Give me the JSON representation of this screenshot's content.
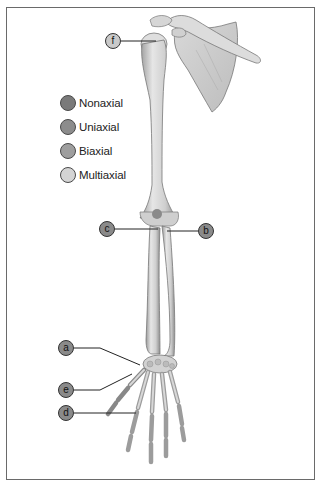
{
  "figure": {
    "title": ""
  },
  "legend": {
    "items": [
      {
        "label": "Nonaxial",
        "color": "#7a7a7a"
      },
      {
        "label": "Uniaxial",
        "color": "#8c8c8c"
      },
      {
        "label": "Biaxial",
        "color": "#9e9e9e"
      },
      {
        "label": "Multiaxial",
        "color": "#d4d4d4"
      }
    ]
  },
  "callouts": {
    "f": {
      "label": "f",
      "color": "#c9c9c9"
    },
    "c": {
      "label": "c",
      "color": "#8a8a8a"
    },
    "b": {
      "label": "b",
      "color": "#8a8a8a"
    },
    "a": {
      "label": "a",
      "color": "#8a8a8a"
    },
    "e": {
      "label": "e",
      "color": "#8a8a8a"
    },
    "d": {
      "label": "d",
      "color": "#8a8a8a"
    }
  }
}
